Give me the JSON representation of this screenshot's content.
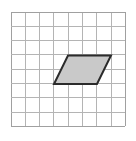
{
  "figure": {
    "canvas": {
      "width": 136,
      "height": 141,
      "background": "#ffffff"
    },
    "grid": {
      "name": "square-grid",
      "origin_x": 11,
      "origin_y": 12,
      "cell_size": 14.3,
      "columns": 8,
      "rows": 8,
      "line_color": "#b4b4b4",
      "line_width": 1,
      "border_color": "#a0a0a0",
      "border_width": 1
    },
    "shape": {
      "name": "parallelogram",
      "type": "parallelogram",
      "fill_color": "#c9c9c9",
      "stroke_color": "#2b2b2b",
      "stroke_width": 2,
      "vertices": [
        {
          "label": "top-left",
          "x": 68,
          "y": 55.5
        },
        {
          "label": "top-right",
          "x": 111,
          "y": 55.5
        },
        {
          "label": "bottom-right",
          "x": 97,
          "y": 84
        },
        {
          "label": "bottom-left",
          "x": 54,
          "y": 84
        }
      ],
      "points_attr": "68,55.5 111,55.5 97,84 54,84",
      "base_cells": 3,
      "height_cells": 2,
      "slant_cells": 1
    }
  }
}
